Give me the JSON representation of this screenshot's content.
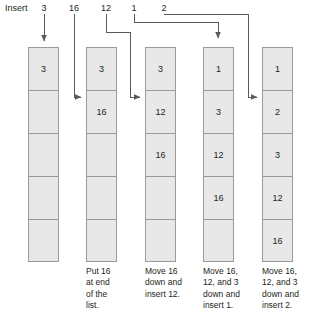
{
  "diagram": {
    "title_label": "Insert",
    "insert_values": [
      {
        "label": "3",
        "x": 44
      },
      {
        "label": "16",
        "x": 74
      },
      {
        "label": "12",
        "x": 106
      },
      {
        "label": "1",
        "x": 134
      },
      {
        "label": "2",
        "x": 164
      }
    ],
    "columns": [
      {
        "name": "column-1",
        "x": 28,
        "cells": [
          "3",
          "",
          "",
          "",
          ""
        ],
        "caption": ""
      },
      {
        "name": "column-2",
        "x": 86,
        "cells": [
          "3",
          "16",
          "",
          "",
          ""
        ],
        "caption": "Put 16\nat end\nof the\nlist."
      },
      {
        "name": "column-3",
        "x": 145,
        "cells": [
          "3",
          "12",
          "16",
          "",
          ""
        ],
        "caption": "Move 16\ndown and\ninsert 12."
      },
      {
        "name": "column-4",
        "x": 203,
        "cells": [
          "1",
          "3",
          "12",
          "16",
          ""
        ],
        "caption": "Move 16,\n12, and 3\ndown and\ninsert 1."
      },
      {
        "name": "column-5",
        "x": 262,
        "cells": [
          "1",
          "2",
          "3",
          "12",
          "16"
        ],
        "caption": "Move 16,\n12, and 3\ndown and\ninsert 2."
      }
    ],
    "colors": {
      "cell_fill": "#e8e8e8",
      "cell_border": "#9a9a9a",
      "text": "#231f20",
      "wire": "#58595b",
      "background": "#ffffff"
    }
  }
}
